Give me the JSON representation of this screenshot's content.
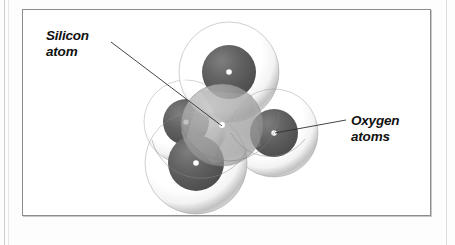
{
  "figure": {
    "background_color": "#ffffff",
    "frame_color": "#8c8c8c",
    "page_color": "#fdfdfd"
  },
  "labels": {
    "silicon": {
      "line1": "Silicon",
      "line2": "atom",
      "style": "bold italic"
    },
    "oxygen": {
      "line1": "Oxygen",
      "line2": "atoms",
      "style": "bold italic"
    }
  },
  "diagram": {
    "type": "molecular-ball-model",
    "central_atom": "silicon",
    "surrounding_atoms": "oxygen",
    "surrounding_count": 4,
    "geometry": "tetrahedral",
    "colors": {
      "oxygen_core": "#5a5a5a",
      "oxygen_shell": "#d8d8d8",
      "silicon_body": "#9a9a9a",
      "center_dot": "#ffffff",
      "leader_line": "#3a3a3a"
    },
    "atoms": [
      {
        "name": "oxygen-top",
        "element": "O",
        "cx": 229,
        "cy": 72,
        "core_r": 27,
        "shell_r": 50
      },
      {
        "name": "oxygen-right",
        "element": "O",
        "cx": 274,
        "cy": 133,
        "core_r": 24,
        "shell_r": 44
      },
      {
        "name": "oxygen-lower-left",
        "element": "O",
        "cx": 196,
        "cy": 163,
        "core_r": 28,
        "shell_r": 51
      },
      {
        "name": "oxygen-left-rear",
        "element": "O",
        "cx": 186,
        "cy": 122,
        "core_r": 23,
        "shell_r": 42
      },
      {
        "name": "silicon-center",
        "element": "Si",
        "cx": 222,
        "cy": 125,
        "core_r": 41,
        "shell_r": 41
      }
    ],
    "leaders": [
      {
        "name": "silicon-leader",
        "x1": 111,
        "y1": 42,
        "x2": 222,
        "y2": 126
      },
      {
        "name": "oxygen-leader",
        "x1": 346,
        "y1": 120,
        "x2": 275,
        "y2": 133
      }
    ]
  }
}
